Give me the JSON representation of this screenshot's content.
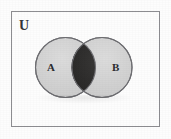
{
  "figure": {
    "kind": "venn-diagram",
    "universe_label": "U",
    "sets": [
      {
        "id": "A",
        "label": "A",
        "fill_color": "#d2d2d2",
        "stroke_color": "#6e6e72"
      },
      {
        "id": "B",
        "label": "B",
        "fill_color": "#d2d2d2",
        "stroke_color": "#6e6e72"
      }
    ],
    "shaded_region": {
      "name": "A-intersect-B",
      "label": "",
      "fill_color": "#302f2f"
    },
    "frame": {
      "stroke_color": "#8d8d91",
      "fill_color": "transparent"
    },
    "background_color": "#fdfdfd"
  }
}
